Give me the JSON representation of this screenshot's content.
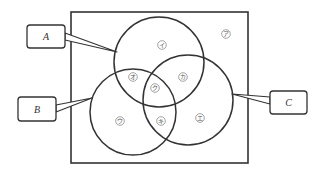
{
  "diagram": {
    "type": "venn-3",
    "universe_frame": {
      "x": 71,
      "y": 12,
      "w": 177,
      "h": 151
    },
    "colors": {
      "stroke": "#333333",
      "text": "#555555",
      "background": "#ffffff"
    },
    "sets": [
      {
        "id": "A",
        "label": "A",
        "cx": 159,
        "cy": 62,
        "r": 45,
        "callout": {
          "x": 27,
          "y": 25,
          "w": 38,
          "h": 23,
          "tip": [
            117,
            52
          ],
          "base": [
            [
              65,
              33
            ],
            [
              65,
              40
            ]
          ]
        }
      },
      {
        "id": "B",
        "label": "B",
        "cx": 133,
        "cy": 112,
        "r": 43,
        "callout": {
          "x": 18,
          "y": 97,
          "w": 38,
          "h": 24,
          "tip": [
            92,
            98
          ],
          "base": [
            [
              56,
              105
            ],
            [
              56,
              112
            ]
          ]
        }
      },
      {
        "id": "C",
        "label": "C",
        "cx": 188,
        "cy": 100,
        "r": 45,
        "callout": {
          "x": 270,
          "y": 91,
          "w": 37,
          "h": 23,
          "tip": [
            232,
            94
          ],
          "base": [
            [
              270,
              97
            ],
            [
              270,
              104
            ]
          ]
        }
      }
    ],
    "regions": [
      {
        "id": "a",
        "label": "ア",
        "desc": "outside all sets",
        "x": 226,
        "y": 34
      },
      {
        "id": "i",
        "label": "イ",
        "desc": "A only",
        "x": 162,
        "y": 45
      },
      {
        "id": "u",
        "label": "ウ",
        "desc": "B only",
        "x": 120,
        "y": 121
      },
      {
        "id": "e",
        "label": "エ",
        "desc": "C only",
        "x": 200,
        "y": 118
      },
      {
        "id": "o",
        "label": "オ",
        "desc": "A and B only",
        "x": 133,
        "y": 77
      },
      {
        "id": "ka",
        "label": "カ",
        "desc": "A and C only",
        "x": 183,
        "y": 77
      },
      {
        "id": "ki",
        "label": "キ",
        "desc": "B and C only",
        "x": 161,
        "y": 121
      },
      {
        "id": "ku",
        "label": "ク",
        "desc": "A, B and C",
        "x": 155,
        "y": 88
      }
    ]
  }
}
